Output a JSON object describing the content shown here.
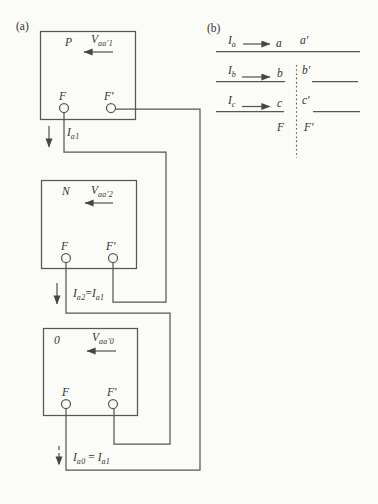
{
  "figure": {
    "background": "#fbfbf8",
    "line_color": "#565656",
    "text_color": "#333333",
    "part_a": {
      "tag": "(a)",
      "networks": [
        {
          "name": "P",
          "voltage_base": "V",
          "voltage_sub": "aa′1",
          "terminal_left": "F",
          "terminal_right": "F′"
        },
        {
          "name": "N",
          "voltage_base": "V",
          "voltage_sub": "aa′2",
          "terminal_left": "F",
          "terminal_right": "F′"
        },
        {
          "name": "0",
          "voltage_base": "V",
          "voltage_sub": "aa′0",
          "terminal_left": "F",
          "terminal_right": "F′"
        }
      ],
      "currents": [
        {
          "base": "I",
          "sub": "a1",
          "eq": "",
          "base2": "",
          "sub2": ""
        },
        {
          "base": "I",
          "sub": "a2",
          "eq": "=",
          "base2": "I",
          "sub2": "a1"
        },
        {
          "base": "I",
          "sub": "a0",
          "eq": " = ",
          "base2": "I",
          "sub2": "a1"
        }
      ]
    },
    "part_b": {
      "tag": "(b)",
      "phases": [
        {
          "current_base": "I",
          "current_sub": "a",
          "terminal": "a",
          "terminal_prime": "a′"
        },
        {
          "current_base": "I",
          "current_sub": "b",
          "terminal": "b",
          "terminal_prime": "b′"
        },
        {
          "current_base": "I",
          "current_sub": "c",
          "terminal": "c",
          "terminal_prime": "c′"
        }
      ],
      "fault_left": "F",
      "fault_right": "F′"
    }
  }
}
